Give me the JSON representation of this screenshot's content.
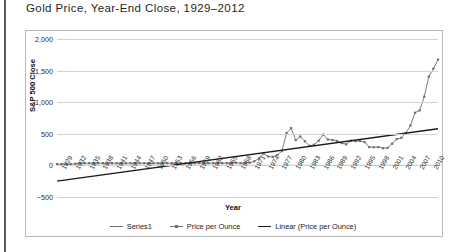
{
  "title": "Gold Price, Year-End Close, 1929–2012",
  "axis": {
    "ylabel": "S&P 500 Close",
    "xlabel": "Year",
    "yticks": [
      "2,000",
      "1,500",
      "1,000",
      "500",
      "0",
      "−500"
    ],
    "ytick_values": [
      2000,
      1500,
      1000,
      500,
      0,
      -500
    ],
    "xticks": [
      "1929",
      "1932",
      "1935",
      "1938",
      "1941",
      "1944",
      "1947",
      "1950",
      "1953",
      "1956",
      "1959",
      "1962",
      "1965",
      "1968",
      "1971",
      "1974",
      "1977",
      "1980",
      "1983",
      "1986",
      "1989",
      "1992",
      "1995",
      "1998",
      "2001",
      "2004",
      "2007",
      "2010"
    ]
  },
  "legend": {
    "position": "bottom",
    "items": [
      {
        "label": "Series1",
        "marker": "line",
        "color": "#6f6f6f"
      },
      {
        "label": "Price per Ounce",
        "marker": "line-marker",
        "color": "#6f6f6f"
      },
      {
        "label": "Linear (Price per Ounce)",
        "marker": "line",
        "color": "#1b1b1b"
      }
    ]
  },
  "colors": {
    "series": "#6f6f6f",
    "trendline": "#1b1b1b",
    "grid": "#d2d2d2",
    "frame": "#b9b9b9",
    "text": "#1a1a1a"
  },
  "chart_data": {
    "type": "line",
    "title": "Gold Price, Year-End Close, 1929–2012",
    "xlabel": "Year",
    "ylabel": "S&P 500 Close",
    "ylim": [
      -500,
      2000
    ],
    "xlim": [
      1929,
      2012
    ],
    "grid": true,
    "legend_position": "bottom",
    "x": [
      1929,
      1930,
      1931,
      1932,
      1933,
      1934,
      1935,
      1936,
      1937,
      1938,
      1939,
      1940,
      1941,
      1942,
      1943,
      1944,
      1945,
      1946,
      1947,
      1948,
      1949,
      1950,
      1951,
      1952,
      1953,
      1954,
      1955,
      1956,
      1957,
      1958,
      1959,
      1960,
      1961,
      1962,
      1963,
      1964,
      1965,
      1966,
      1967,
      1968,
      1969,
      1970,
      1971,
      1972,
      1973,
      1974,
      1975,
      1976,
      1977,
      1978,
      1979,
      1980,
      1981,
      1982,
      1983,
      1984,
      1985,
      1986,
      1987,
      1988,
      1989,
      1990,
      1991,
      1992,
      1993,
      1994,
      1995,
      1996,
      1997,
      1998,
      1999,
      2000,
      2001,
      2002,
      2003,
      2004,
      2005,
      2006,
      2007,
      2008,
      2009,
      2010,
      2011,
      2012
    ],
    "series": [
      {
        "name": "Price per Ounce",
        "marker": "square",
        "values": [
          20.63,
          20.65,
          17.06,
          20.69,
          26.33,
          34.69,
          34.84,
          34.87,
          34.79,
          34.85,
          34.42,
          33.85,
          33.85,
          33.85,
          33.85,
          33.85,
          34.71,
          34.71,
          34.71,
          34.71,
          31.69,
          34.72,
          34.72,
          34.6,
          34.84,
          35.04,
          35.03,
          34.99,
          34.95,
          35.1,
          35.1,
          36.5,
          35.5,
          35.35,
          35.25,
          35.35,
          35.5,
          35.45,
          35.2,
          41.9,
          35.2,
          37.44,
          43.6,
          64.9,
          112.25,
          186.5,
          140.25,
          134.5,
          164.95,
          226,
          512,
          589.75,
          400,
          456.9,
          382.4,
          308.3,
          327,
          390.9,
          486.5,
          410.3,
          401,
          386.2,
          353.4,
          333.25,
          391.75,
          383.25,
          387,
          369.25,
          290.2,
          287.8,
          290.25,
          272.65,
          276.5,
          342.75,
          417.25,
          435.6,
          513,
          632,
          833.75,
          869.75,
          1087.5,
          1405.5,
          1531,
          1675
        ]
      },
      {
        "name": "Series1",
        "marker": "none",
        "values": [
          0,
          0,
          0,
          0,
          0,
          0,
          0,
          0,
          0,
          0,
          0,
          0,
          0,
          0,
          0,
          0,
          0,
          0,
          0,
          0,
          0,
          0,
          0,
          0,
          0,
          0,
          0,
          0,
          0,
          0,
          0,
          0,
          0,
          0,
          0,
          0,
          0,
          0,
          0,
          0,
          0,
          0,
          0,
          0,
          0,
          0,
          0,
          0,
          0,
          0,
          0,
          0,
          0,
          0,
          0,
          0,
          0,
          0,
          0,
          0,
          0,
          0,
          0,
          0,
          0,
          0,
          0,
          0,
          0,
          0,
          0,
          0,
          0,
          0,
          0,
          0,
          0,
          0,
          0,
          0,
          0,
          0,
          0,
          0
        ]
      }
    ],
    "trendline": {
      "name": "Linear (Price per Ounce)",
      "type": "linear",
      "x_start": 1929,
      "y_start": -250,
      "x_end": 2012,
      "y_end": 580
    },
    "annotations": []
  }
}
